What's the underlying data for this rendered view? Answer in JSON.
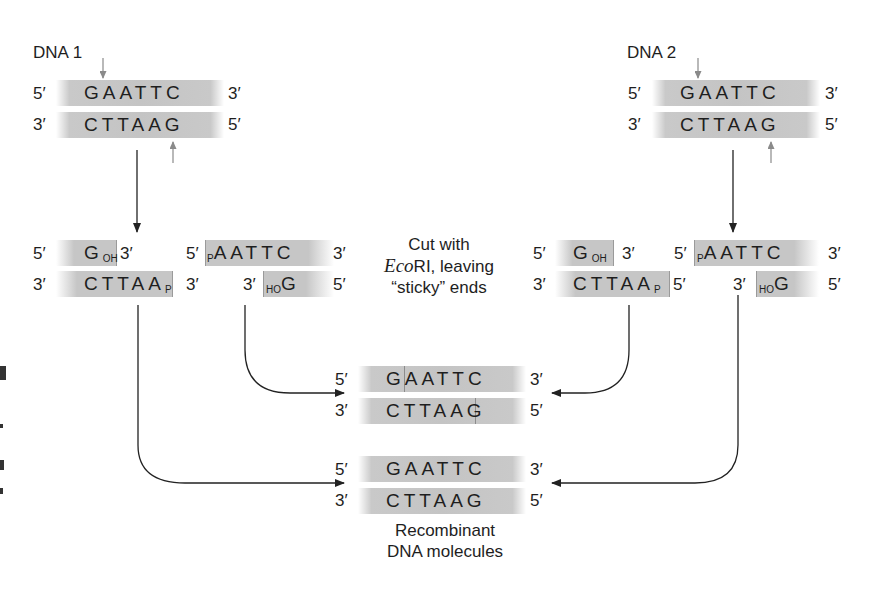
{
  "dna1": {
    "title": "DNA 1",
    "top": {
      "left": "5′",
      "seq": "GAATTC",
      "right": "3′"
    },
    "bottom": {
      "left": "3′",
      "seq": "CTTAAG",
      "right": "5′"
    }
  },
  "dna2": {
    "title": "DNA 2",
    "top": {
      "left": "5′",
      "seq": "GAATTC",
      "right": "3′"
    },
    "bottom": {
      "left": "3′",
      "seq": "CTTAAG",
      "right": "5′"
    }
  },
  "cut1": {
    "fragA": {
      "top": {
        "left": "5′",
        "base": "G",
        "sub": "OH",
        "right": "3′"
      },
      "bottom": {
        "left": "3′",
        "seq": "CTTAA",
        "sub": "P",
        "right": "3′"
      }
    },
    "fragB": {
      "top": {
        "left": "5′",
        "sub": "P",
        "seq": "AATTC",
        "right": "3′"
      },
      "bottom": {
        "left": "3′",
        "sub": "HO",
        "base": "G",
        "right": "5′"
      }
    }
  },
  "cut2": {
    "fragA": {
      "top": {
        "left": "5′",
        "base": "G",
        "sub": "OH",
        "right": "3′"
      },
      "bottom": {
        "left": "3′",
        "seq": "CTTAA",
        "sub": "P",
        "right": "5′"
      }
    },
    "fragB": {
      "top": {
        "left": "5′",
        "sub": "P",
        "seq": "AATTC",
        "right": "3′"
      },
      "bottom": {
        "left": "3′",
        "sub": "HO",
        "base": "G",
        "right": "5′"
      }
    }
  },
  "cut_caption": {
    "line1": "Cut with",
    "enzyme_italic": "Eco",
    "enzyme_rest": "RI, leaving",
    "line3": "“sticky” ends"
  },
  "recomb1": {
    "top": {
      "left": "5′",
      "seq": "GAATTC",
      "right": "3′"
    },
    "bottom": {
      "left": "3′",
      "seq": "CTTAAG",
      "right": "5′"
    }
  },
  "recomb2": {
    "top": {
      "left": "5′",
      "seq": "GAATTC",
      "right": "3′"
    },
    "bottom": {
      "left": "3′",
      "seq": "CTTAAG",
      "right": "5′"
    }
  },
  "recomb_caption": {
    "line1": "Recombinant",
    "line2": "DNA molecules"
  },
  "colors": {
    "strip": "#c6c6c6",
    "cut_arrow": "#8a8a8a",
    "flow_arrow": "#222222",
    "text": "#1e1e1e"
  }
}
